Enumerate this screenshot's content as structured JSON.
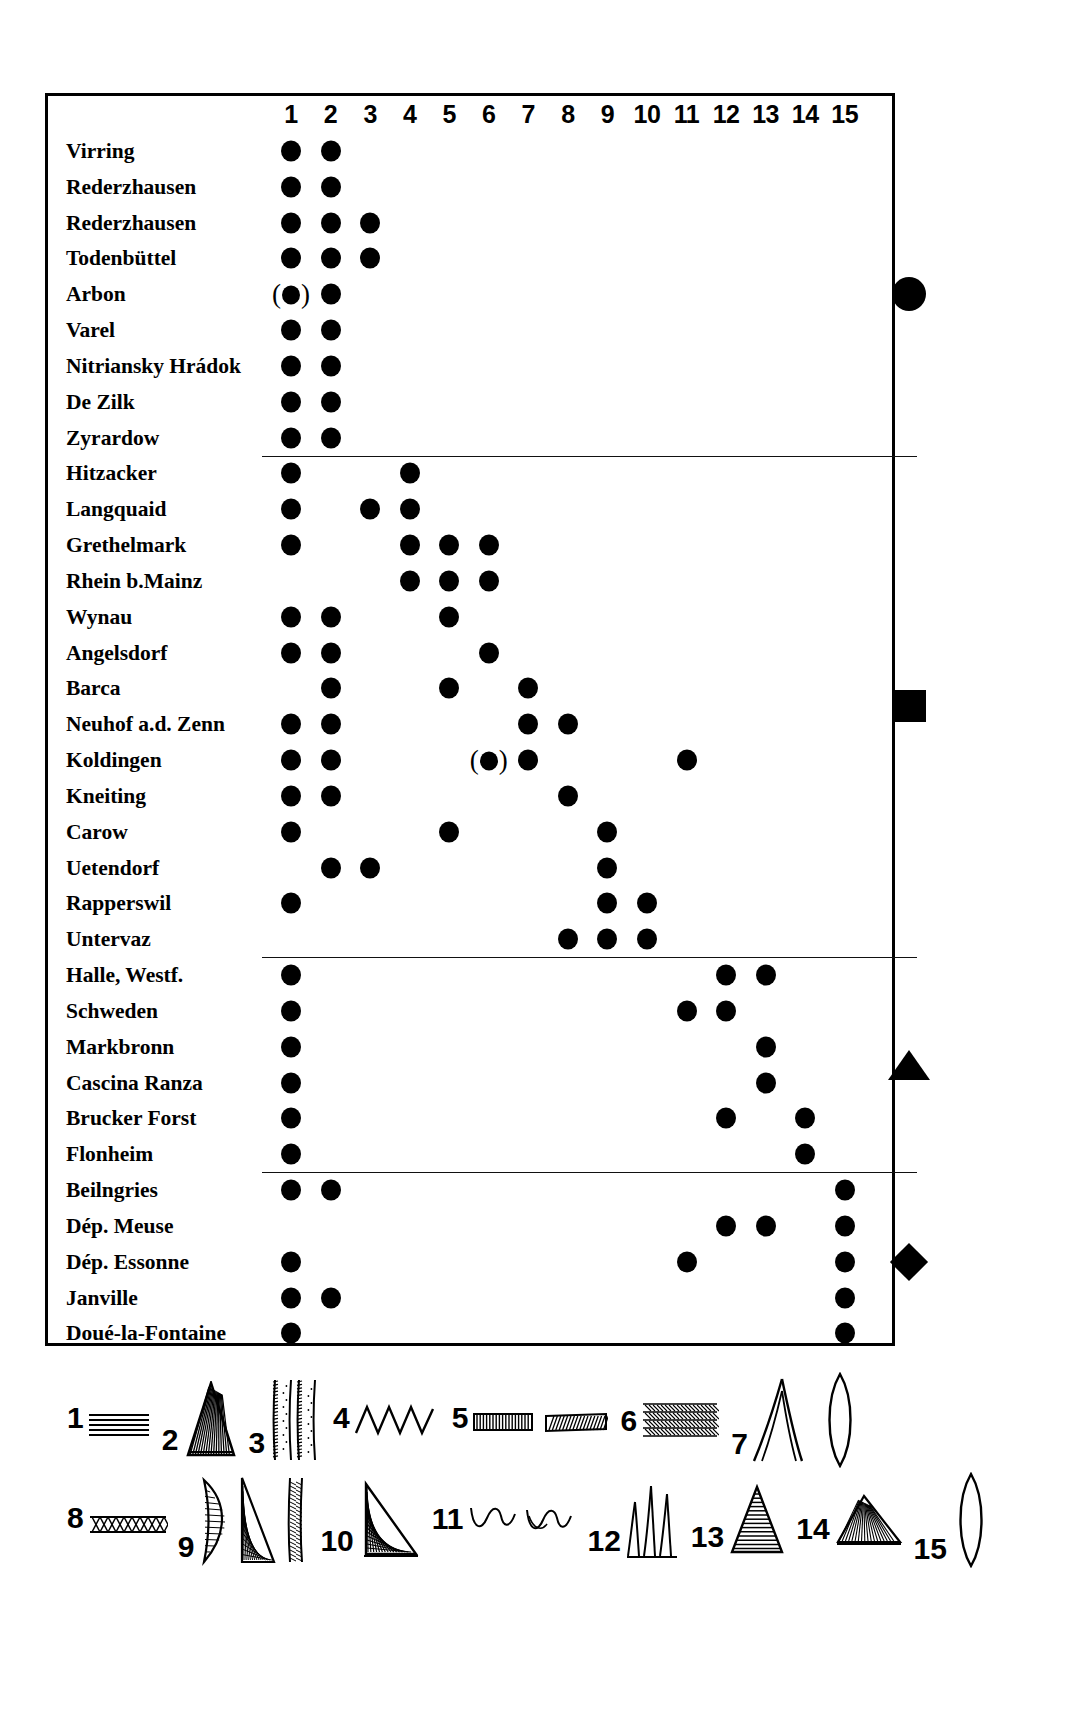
{
  "chart_data": {
    "type": "table",
    "title": "",
    "columns": [
      "1",
      "2",
      "3",
      "4",
      "5",
      "6",
      "7",
      "8",
      "9",
      "10",
      "11",
      "12",
      "13",
      "14",
      "15"
    ],
    "groups": [
      {
        "marker": "circle",
        "rows": [
          {
            "site": "Virring",
            "cols": [
              1,
              2
            ],
            "uncertain": []
          },
          {
            "site": "Rederzhausen",
            "cols": [
              1,
              2
            ],
            "uncertain": []
          },
          {
            "site": "Rederzhausen",
            "cols": [
              1,
              2,
              3
            ],
            "uncertain": []
          },
          {
            "site": "Todenbüttel",
            "cols": [
              1,
              2,
              3
            ],
            "uncertain": []
          },
          {
            "site": "Arbon",
            "cols": [
              1,
              2
            ],
            "uncertain": [
              1
            ]
          },
          {
            "site": "Varel",
            "cols": [
              1,
              2
            ],
            "uncertain": []
          },
          {
            "site": "Nitriansky Hrádok",
            "cols": [
              1,
              2
            ],
            "uncertain": []
          },
          {
            "site": "De Zilk",
            "cols": [
              1,
              2
            ],
            "uncertain": []
          },
          {
            "site": "Zyrardow",
            "cols": [
              1,
              2
            ],
            "uncertain": []
          }
        ]
      },
      {
        "marker": "square",
        "rows": [
          {
            "site": "Hitzacker",
            "cols": [
              1,
              4
            ],
            "uncertain": []
          },
          {
            "site": "Langquaid",
            "cols": [
              1,
              3,
              4
            ],
            "uncertain": []
          },
          {
            "site": "Grethelmark",
            "cols": [
              1,
              4,
              5,
              6
            ],
            "uncertain": []
          },
          {
            "site": "Rhein b.Mainz",
            "cols": [
              4,
              5,
              6
            ],
            "uncertain": []
          },
          {
            "site": "Wynau",
            "cols": [
              1,
              2,
              5
            ],
            "uncertain": []
          },
          {
            "site": "Angelsdorf",
            "cols": [
              1,
              2,
              6
            ],
            "uncertain": []
          },
          {
            "site": "Barca",
            "cols": [
              2,
              5,
              7
            ],
            "uncertain": []
          },
          {
            "site": "Neuhof a.d. Zenn",
            "cols": [
              1,
              2,
              7,
              8
            ],
            "uncertain": []
          },
          {
            "site": "Koldingen",
            "cols": [
              1,
              2,
              6,
              7,
              11
            ],
            "uncertain": [
              6
            ]
          },
          {
            "site": "Kneiting",
            "cols": [
              1,
              2,
              8
            ],
            "uncertain": []
          },
          {
            "site": "Carow",
            "cols": [
              1,
              5,
              9
            ],
            "uncertain": []
          },
          {
            "site": "Uetendorf",
            "cols": [
              2,
              3,
              9
            ],
            "uncertain": []
          },
          {
            "site": "Rapperswil",
            "cols": [
              1,
              9,
              10
            ],
            "uncertain": []
          },
          {
            "site": "Untervaz",
            "cols": [
              8,
              9,
              10
            ],
            "uncertain": []
          }
        ]
      },
      {
        "marker": "triangle",
        "rows": [
          {
            "site": "Halle, Westf.",
            "cols": [
              1,
              12,
              13
            ],
            "uncertain": []
          },
          {
            "site": "Schweden",
            "cols": [
              1,
              11,
              12
            ],
            "uncertain": []
          },
          {
            "site": "Markbronn",
            "cols": [
              1,
              13
            ],
            "uncertain": []
          },
          {
            "site": "Cascina Ranza",
            "cols": [
              1,
              13
            ],
            "uncertain": []
          },
          {
            "site": "Brucker Forst",
            "cols": [
              1,
              12,
              14
            ],
            "uncertain": []
          },
          {
            "site": "Flonheim",
            "cols": [
              1,
              14
            ],
            "uncertain": []
          }
        ]
      },
      {
        "marker": "diamond",
        "rows": [
          {
            "site": "Beilngries",
            "cols": [
              1,
              2,
              15
            ],
            "uncertain": []
          },
          {
            "site": "Dép. Meuse",
            "cols": [
              12,
              13,
              15
            ],
            "uncertain": []
          },
          {
            "site": "Dép. Essonne",
            "cols": [
              1,
              11,
              15
            ],
            "uncertain": []
          },
          {
            "site": "Janville",
            "cols": [
              1,
              2,
              15
            ],
            "uncertain": []
          },
          {
            "site": "Doué-la-Fontaine",
            "cols": [
              1,
              15
            ],
            "uncertain": []
          }
        ]
      }
    ]
  },
  "legend": {
    "row1": [
      {
        "num": "1",
        "symbol": "horizontal-lines"
      },
      {
        "num": "2",
        "symbol": "hatched-triangle-tall"
      },
      {
        "num": "3",
        "symbol": "double-stippled-band"
      },
      {
        "num": "4",
        "symbol": "zigzag"
      },
      {
        "num": "5",
        "symbol": "vertical-hatched-band"
      },
      {
        "num": "6",
        "symbol": "herringbone-band"
      },
      {
        "num": "7",
        "symbol": "double-arch"
      }
    ],
    "row2": [
      {
        "num": "8",
        "symbol": "lattice-band"
      },
      {
        "num": "9",
        "symbol": "leaf-and-triangle-group"
      },
      {
        "num": "10",
        "symbol": "hatched-right-triangle"
      },
      {
        "num": "11",
        "symbol": "wavy-arcs-pair"
      },
      {
        "num": "12",
        "symbol": "triple-spike"
      },
      {
        "num": "13",
        "symbol": "line-filled-triangle"
      },
      {
        "num": "14",
        "symbol": "hatched-squat-triangle"
      },
      {
        "num": "15",
        "symbol": "lens-outline"
      }
    ]
  },
  "colors": {
    "ink": "#000000",
    "background": "#ffffff"
  }
}
